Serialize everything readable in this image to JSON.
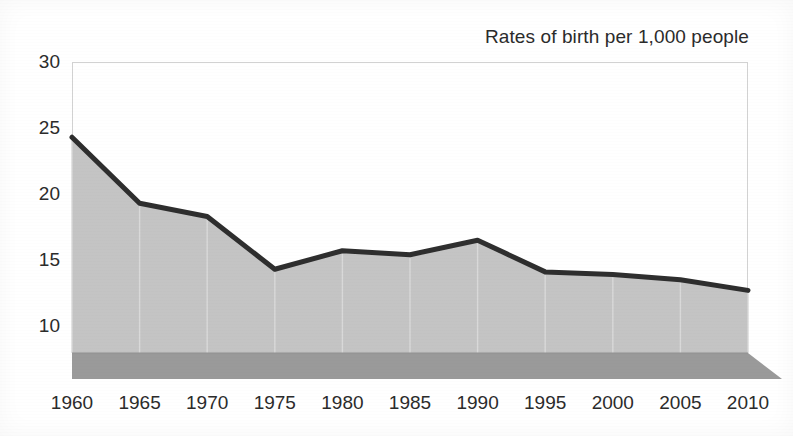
{
  "chart_data": {
    "type": "area",
    "title": "Rates of birth per 1,000 people",
    "xlabel": "",
    "ylabel": "",
    "categories": [
      "1960",
      "1965",
      "1970",
      "1975",
      "1980",
      "1985",
      "1990",
      "1995",
      "2000",
      "2005",
      "2010"
    ],
    "values": [
      24.3,
      19.3,
      18.3,
      14.3,
      15.7,
      15.4,
      16.5,
      14.1,
      13.9,
      13.5,
      12.7
    ],
    "series": [
      {
        "name": "Rates of birth per 1,000 people",
        "values": [
          24.3,
          19.3,
          18.3,
          14.3,
          15.7,
          15.4,
          16.5,
          14.1,
          13.9,
          13.5,
          12.7
        ]
      }
    ],
    "ylim": [
      7.5,
      30
    ],
    "yticks": [
      10,
      15,
      20,
      25,
      30
    ],
    "ytick_labels": [
      "10",
      "15",
      "20",
      "25",
      "30"
    ],
    "xlim": [
      "1960",
      "2010"
    ],
    "grid": true,
    "grid_axis": "y",
    "legend": false,
    "legend_position": "none",
    "style_3d": true,
    "colors": {
      "line": "#2e2e2e",
      "area_fill": "#c4c4c4",
      "base_band": "#9a9a9a",
      "gridline": "#d2d2d2",
      "text": "#2b2b2b",
      "background": "#ffffff"
    }
  },
  "axis": {
    "y_tick_labels": [
      "30",
      "25",
      "20",
      "15",
      "10"
    ],
    "x_tick_labels": [
      "1960",
      "1965",
      "1970",
      "1975",
      "1980",
      "1985",
      "1990",
      "1995",
      "2000",
      "2005",
      "2010"
    ]
  },
  "title": {
    "text": "Rates of birth per 1,000 people"
  }
}
